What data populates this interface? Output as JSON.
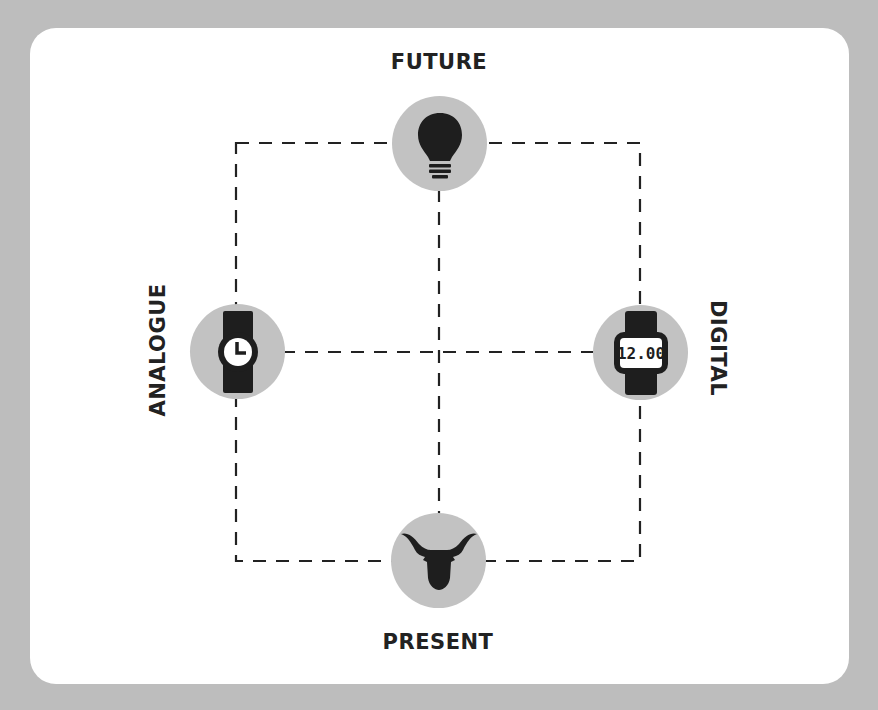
{
  "diagram": {
    "type": "quadrant-axes",
    "colors": {
      "background": "#bdbdbd",
      "card": "#ffffff",
      "node_fill": "#c2c2c2",
      "icon": "#1e1e1e",
      "line": "#222222",
      "text": "#222222"
    },
    "axes": {
      "vertical": {
        "top": "FUTURE",
        "bottom": "PRESENT"
      },
      "horizontal": {
        "left": "ANALOGUE",
        "right": "DIGITAL"
      }
    },
    "nodes": [
      {
        "id": "future",
        "label": "FUTURE",
        "icon": "lightbulb-icon",
        "position": "top"
      },
      {
        "id": "analogue",
        "label": "ANALOGUE",
        "icon": "analog-watch-icon",
        "position": "left"
      },
      {
        "id": "digital",
        "label": "DIGITAL",
        "icon": "digital-watch-icon",
        "position": "right",
        "icon_text": "12.00"
      },
      {
        "id": "present",
        "label": "PRESENT",
        "icon": "longhorn-bull-icon",
        "position": "bottom"
      }
    ],
    "connectors": {
      "style": "dashed",
      "outer_rectangle": true,
      "center_cross": true
    }
  }
}
